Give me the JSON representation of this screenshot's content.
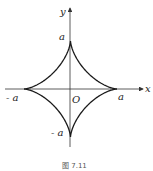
{
  "diagram": {
    "type": "astroid",
    "equation": "x^(2/3) + y^(2/3) = a^(2/3)",
    "axes": {
      "x_label": "x",
      "y_label": "y",
      "origin_label": "O"
    },
    "tick_labels": {
      "pos_x": "a",
      "neg_x": "- a",
      "pos_y": "a",
      "neg_y": "- a"
    },
    "caption": "图 7.11",
    "colors": {
      "curve": "#1a1a1a",
      "axis": "#333333",
      "background": "#ffffff"
    }
  }
}
